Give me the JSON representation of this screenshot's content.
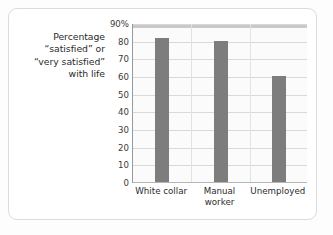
{
  "figure": {
    "y_axis_caption_lines": [
      "Percentage",
      "“satisfied” or",
      "“very satisfied”",
      "with life"
    ]
  },
  "colors": {
    "bar_fill": "#7d7d7d",
    "gridline": "#d9d9d9",
    "plot_background": "#fbfbfb",
    "card_border": "#dcdcdc",
    "top_band": "#c9c9c9",
    "text": "#2b2b2b"
  },
  "chart_data": {
    "type": "bar",
    "title": "",
    "subtitle": "",
    "xlabel": "",
    "ylabel": "Percentage “satisfied” or “very satisfied” with life",
    "categories": [
      "White collar",
      "Manual worker",
      "Unemployed"
    ],
    "category_label_lines": [
      [
        "White collar"
      ],
      [
        "Manual",
        "worker"
      ],
      [
        "Unemployed"
      ]
    ],
    "values": [
      82,
      80.5,
      60.5
    ],
    "ylim": [
      0,
      90
    ],
    "ytick_values": [
      0,
      10,
      20,
      30,
      40,
      50,
      60,
      70,
      80,
      90
    ],
    "ytick_labels": [
      "0",
      "10",
      "20",
      "30",
      "40",
      "50",
      "60",
      "70",
      "80",
      "90%"
    ],
    "grid": true,
    "grid_orientation": "horizontal",
    "legend": false,
    "legend_position": "none",
    "series": [
      {
        "name": "Percentage satisfied or very satisfied with life",
        "values": [
          82,
          80.5,
          60.5
        ]
      }
    ]
  }
}
